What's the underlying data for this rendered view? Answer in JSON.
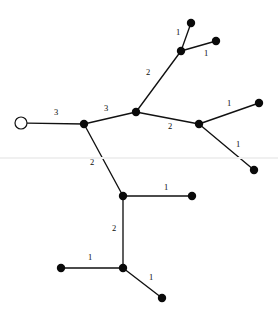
{
  "diagram": {
    "type": "weighted-tree-graph",
    "canvas": {
      "width": 278,
      "height": 316,
      "background": "#ffffff"
    },
    "style": {
      "edge_color": "#111111",
      "node_fill": "#0a0a0a",
      "root_fill": "#ffffff",
      "label_color": "#0d0d0d"
    },
    "nodes": [
      {
        "id": "root",
        "label": "root-node",
        "x": 21,
        "y": 123,
        "kind": "open",
        "radius": 6.0
      },
      {
        "id": "n1",
        "label": "branch-node-1",
        "x": 84,
        "y": 124,
        "kind": "filled",
        "radius": 4.2
      },
      {
        "id": "n2",
        "label": "branch-node-2",
        "x": 136,
        "y": 112,
        "kind": "filled",
        "radius": 4.2
      },
      {
        "id": "n3",
        "label": "branch-node-3",
        "x": 181,
        "y": 51,
        "kind": "filled",
        "radius": 4.2
      },
      {
        "id": "n4",
        "label": "leaf-node-top",
        "x": 191,
        "y": 23,
        "kind": "filled",
        "radius": 4.2
      },
      {
        "id": "n5",
        "label": "leaf-node-top-right",
        "x": 216,
        "y": 41,
        "kind": "filled",
        "radius": 4.2
      },
      {
        "id": "n6",
        "label": "branch-node-4",
        "x": 199,
        "y": 124,
        "kind": "filled",
        "radius": 4.2
      },
      {
        "id": "n7",
        "label": "leaf-node-right-up",
        "x": 259,
        "y": 103,
        "kind": "filled",
        "radius": 4.2
      },
      {
        "id": "n8",
        "label": "leaf-node-right-down",
        "x": 254,
        "y": 170,
        "kind": "filled",
        "radius": 4.2
      },
      {
        "id": "n9",
        "label": "branch-node-5",
        "x": 123,
        "y": 196,
        "kind": "filled",
        "radius": 4.2
      },
      {
        "id": "n10",
        "label": "leaf-node-middle",
        "x": 192,
        "y": 196,
        "kind": "filled",
        "radius": 4.2
      },
      {
        "id": "n11",
        "label": "branch-node-6",
        "x": 123,
        "y": 268,
        "kind": "filled",
        "radius": 4.2
      },
      {
        "id": "n12",
        "label": "leaf-node-bottom-left",
        "x": 61,
        "y": 268,
        "kind": "filled",
        "radius": 4.2
      },
      {
        "id": "n13",
        "label": "leaf-node-bottom",
        "x": 162,
        "y": 298,
        "kind": "filled",
        "radius": 4.2
      }
    ],
    "edges": [
      {
        "id": "e1",
        "from": "root",
        "to": "n1",
        "weight": "3",
        "label_x": 56,
        "label_y": 113
      },
      {
        "id": "e2",
        "from": "n1",
        "to": "n2",
        "weight": "3",
        "label_x": 106,
        "label_y": 109
      },
      {
        "id": "e3",
        "from": "n2",
        "to": "n3",
        "weight": "2",
        "label_x": 148,
        "label_y": 73
      },
      {
        "id": "e4",
        "from": "n3",
        "to": "n4",
        "weight": "1",
        "label_x": 178,
        "label_y": 33
      },
      {
        "id": "e5",
        "from": "n3",
        "to": "n5",
        "weight": "1",
        "label_x": 206,
        "label_y": 54
      },
      {
        "id": "e6",
        "from": "n2",
        "to": "n6",
        "weight": "2",
        "label_x": 170,
        "label_y": 127
      },
      {
        "id": "e7",
        "from": "n6",
        "to": "n7",
        "weight": "1",
        "label_x": 229,
        "label_y": 104
      },
      {
        "id": "e8",
        "from": "n6",
        "to": "n8",
        "weight": "1",
        "label_x": 238,
        "label_y": 145
      },
      {
        "id": "e9",
        "from": "n1",
        "to": "n9",
        "weight": "2",
        "label_x": 92,
        "label_y": 163
      },
      {
        "id": "e10",
        "from": "n9",
        "to": "n10",
        "weight": "1",
        "label_x": 166,
        "label_y": 188
      },
      {
        "id": "e11",
        "from": "n9",
        "to": "n11",
        "weight": "2",
        "label_x": 114,
        "label_y": 229
      },
      {
        "id": "e12",
        "from": "n11",
        "to": "n12",
        "weight": "1",
        "label_x": 90,
        "label_y": 258
      },
      {
        "id": "e13",
        "from": "n11",
        "to": "n13",
        "weight": "1",
        "label_x": 151,
        "label_y": 278
      }
    ],
    "artifacts": [
      {
        "id": "a1",
        "name": "scan-line",
        "y": 157
      }
    ]
  }
}
